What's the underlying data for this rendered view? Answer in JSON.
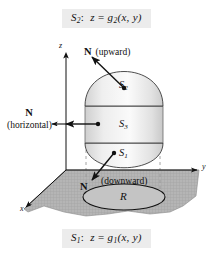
{
  "figure": {
    "title_caption_top": "S2:  z = g2(x, y)",
    "title_caption_bottom": "S1:  z = g1(x, y)",
    "background_color": "#ffffff",
    "label_box_color": "#ececec",
    "surface_fill_color": "#e6e6e6",
    "plane_fill_color": "#b8b8b8",
    "stroke_color": "#111111"
  },
  "captions": {
    "top": {
      "surface": "S",
      "surface_sub": "2",
      "sep": ":",
      "z": "z",
      "eq": "=",
      "fn": "g",
      "fn_sub": "2",
      "args": "(x, y)"
    },
    "bottom": {
      "surface": "S",
      "surface_sub": "1",
      "sep": ":",
      "z": "z",
      "eq": "=",
      "fn": "g",
      "fn_sub": "1",
      "args": "(x, y)"
    }
  },
  "axes": {
    "z": "z",
    "y": "y",
    "x": "x"
  },
  "normals": [
    {
      "id": "upward",
      "symbol": "N",
      "qualifier": "(upward)",
      "direction": "upward"
    },
    {
      "id": "horizontal",
      "symbol": "N",
      "qualifier": "(horizontal)",
      "direction": "horizontal"
    },
    {
      "id": "downward",
      "symbol": "N",
      "qualifier": "(downward)",
      "direction": "downward"
    }
  ],
  "surfaces": [
    {
      "id": "S2",
      "label": "S",
      "sub": "2",
      "role": "top-cap"
    },
    {
      "id": "S3",
      "label": "S",
      "sub": "3",
      "role": "lateral-band"
    },
    {
      "id": "S1",
      "label": "S",
      "sub": "1",
      "role": "bottom-cap"
    }
  ],
  "region": {
    "label": "R",
    "description": "projection region in xy-plane"
  }
}
